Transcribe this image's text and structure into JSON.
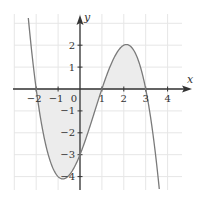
{
  "chart_data": {
    "type": "line",
    "title": "",
    "xlabel": "x",
    "ylabel": "y",
    "function": "y = -0.5(x+2)(x-1)(x-3)",
    "xlim": [
      -3,
      5
    ],
    "ylim": [
      -4.6,
      3.3
    ],
    "grid": true,
    "x_ticks": [
      -2,
      -1,
      0,
      1,
      2,
      3,
      4
    ],
    "x_tick_labels": [
      "−2",
      "−1",
      "0",
      "1",
      "2",
      "3",
      "4"
    ],
    "y_ticks": [
      2,
      1,
      -1,
      -2,
      -3,
      -4
    ],
    "y_tick_labels": [
      "2",
      "1",
      "−1",
      "−2",
      "−3",
      "−4"
    ],
    "origin_label": "0",
    "roots": [
      -2,
      1,
      3
    ],
    "key_points": [
      {
        "x": -1,
        "y": -4,
        "label": "local minimum"
      },
      {
        "x": 0,
        "y": -3,
        "label": "y-intercept"
      },
      {
        "x": 2,
        "y": 2,
        "label": "local maximum"
      }
    ],
    "shaded_regions": [
      {
        "from": -2,
        "to": 1,
        "side": "below x-axis"
      },
      {
        "from": 1,
        "to": 3,
        "side": "above x-axis"
      }
    ],
    "colors": {
      "curve": "#7a7a7a",
      "axis": "#333333",
      "grid": "#e6e6e6",
      "shade": "#ececec"
    }
  }
}
